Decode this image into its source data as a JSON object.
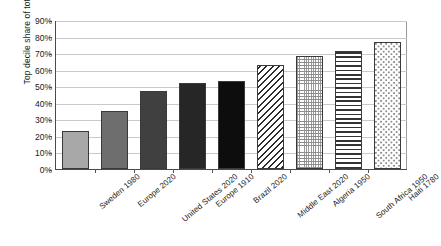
{
  "chart_data": {
    "type": "bar",
    "title": "",
    "xlabel": "",
    "ylabel": "Top decile share of total income",
    "ylim": [
      0,
      90
    ],
    "y_tick_labels": [
      "90%",
      "80%",
      "70%",
      "60%",
      "50%",
      "40%",
      "30%",
      "20%",
      "10%",
      "0%"
    ],
    "y_tick_values": [
      90,
      80,
      70,
      60,
      50,
      40,
      30,
      20,
      10,
      0
    ],
    "grid": true,
    "legend": "none",
    "categories": [
      "Sweden 1980",
      "Europe 2020",
      "United States 2020",
      "Europe 1910",
      "Brazil 2020",
      "Middle East 2020",
      "Algeria 1950",
      "South Africa 1950",
      "Haiti 1780"
    ],
    "values": [
      23,
      35,
      47,
      52,
      53,
      63,
      68,
      71,
      77
    ],
    "bar_fills": [
      "gray-light",
      "gray-mid",
      "gray-dark",
      "near-black",
      "black",
      "diagonal-hatch",
      "stipple",
      "horizontal-lines",
      "dots"
    ]
  }
}
